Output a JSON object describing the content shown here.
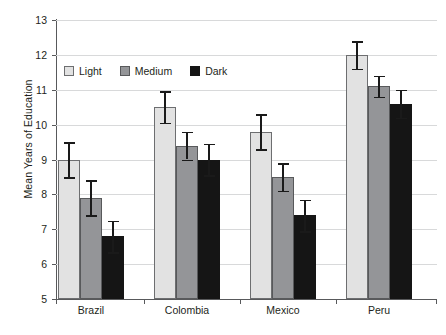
{
  "chart_data": {
    "type": "bar",
    "title": "",
    "xlabel": "",
    "ylabel": "Mean Years of Education",
    "ylim": [
      5,
      13
    ],
    "ytick_labels": [
      "13",
      "12",
      "11",
      "10",
      "9",
      "8",
      "7",
      "6",
      "5"
    ],
    "yticks": [
      13,
      12,
      11,
      10,
      9,
      8,
      7,
      6,
      5
    ],
    "grid": true,
    "legend_position": "upper-left-inside",
    "categories": [
      "Brazil",
      "Colombia",
      "Mexico",
      "Peru"
    ],
    "series": [
      {
        "name": "Light",
        "color": "#e2e2e2",
        "values": [
          9.0,
          10.5,
          9.8,
          12.0
        ],
        "errors": [
          0.5,
          0.45,
          0.5,
          0.4
        ]
      },
      {
        "name": "Medium",
        "color": "#949598",
        "values": [
          7.9,
          9.4,
          8.5,
          11.1
        ],
        "errors": [
          0.5,
          0.4,
          0.4,
          0.3
        ]
      },
      {
        "name": "Dark",
        "color": "#151515",
        "values": [
          6.8,
          9.0,
          7.4,
          10.6
        ],
        "errors": [
          0.45,
          0.45,
          0.45,
          0.4
        ]
      }
    ]
  },
  "legend": {
    "items": [
      {
        "label": "Light",
        "swatch": "light"
      },
      {
        "label": "Medium",
        "swatch": "medium"
      },
      {
        "label": "Dark",
        "swatch": "dark"
      }
    ]
  },
  "axes": {
    "y_title": "Mean Years of Education"
  },
  "colors": {
    "light": "#e2e2e2",
    "medium": "#949598",
    "dark": "#151515",
    "gridline": "#d8d9da",
    "axis": "#58595b",
    "text": "#231f20"
  }
}
